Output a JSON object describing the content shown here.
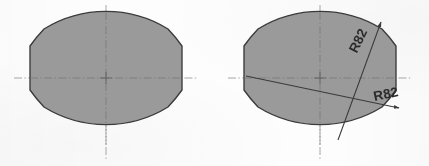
{
  "drawing": {
    "title": "Two barrel-profile (squircle) outlines, right view dimensioned",
    "background_color": "#fdfdfd",
    "fill_color": "#9a9a9a",
    "outline_color": "#3a3a3a",
    "centerline_color": "#8c8c8c",
    "leader_color": "#4a4a4a",
    "text_color": "#2b2b2b"
  },
  "views": [
    {
      "id": "left-view",
      "name": "Undimensioned profile view",
      "center": {
        "x": 106,
        "y": 78
      },
      "half_width": 76,
      "half_height": 67,
      "corner_flat": 12,
      "centerline_overhang": 16,
      "annotations": []
    },
    {
      "id": "right-view",
      "name": "Dimensioned profile view",
      "center": {
        "x": 320,
        "y": 78
      },
      "half_width": 76,
      "half_height": 67,
      "corner_flat": 12,
      "centerline_overhang": 16,
      "annotations": [
        {
          "id": "radius-upper",
          "label": "R82",
          "label_x": 359,
          "label_y": 41,
          "label_rotation": -64,
          "leader_from": {
            "x": 338,
            "y": 140
          },
          "leader_to": {
            "x": 381,
            "y": 22
          },
          "arrow_at": "end"
        },
        {
          "id": "radius-lower",
          "label": "R82",
          "label_x": 386,
          "label_y": 95,
          "label_rotation": -12,
          "leader_from": {
            "x": 246,
            "y": 76
          },
          "leader_to": {
            "x": 399,
            "y": 108
          },
          "arrow_at": "end"
        }
      ]
    }
  ],
  "labels": {
    "radius_value": "R82",
    "radius_symbol": "R",
    "radius_number": "82",
    "units": ""
  },
  "centerlines": {
    "pattern": "dash-dot",
    "vertical": true,
    "horizontal": true
  },
  "scan_artifacts": {
    "ghost_watermark": "WCAD"
  }
}
